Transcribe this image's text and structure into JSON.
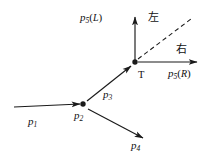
{
  "figure": {
    "kind": "momentum-vector-diagram",
    "background_color": "#ffffff",
    "stroke_color": "#1a1a1a",
    "width": 220,
    "height": 158
  },
  "vertices": [
    {
      "id": "p2",
      "label": "p",
      "subscript": "2",
      "x": 83,
      "y": 104
    },
    {
      "id": "T",
      "label": "T",
      "x": 135,
      "y": 62
    }
  ],
  "labels": {
    "p1": {
      "base": "p",
      "sub": "1",
      "x": 28,
      "y": 116
    },
    "p2": {
      "base": "p",
      "sub": "2",
      "x": 74,
      "y": 110
    },
    "p3": {
      "base": "p",
      "sub": "3",
      "x": 103,
      "y": 89
    },
    "p4": {
      "base": "p",
      "sub": "4",
      "x": 131,
      "y": 140
    },
    "p5L": {
      "base": "p",
      "sub": "5",
      "open": "(",
      "arg": "L",
      "close": ")",
      "x": 80,
      "y": 12
    },
    "p5R": {
      "base": "p",
      "sub": "5",
      "open": "(",
      "arg": "R",
      "close": ")",
      "x": 168,
      "y": 68
    },
    "vertexT": {
      "text": "T",
      "x": 138,
      "y": 70
    },
    "left_cjk": {
      "text": "左",
      "x": 148,
      "y": 12
    },
    "right_cjk": {
      "text": "右",
      "x": 176,
      "y": 44
    }
  },
  "arrows": [
    {
      "name": "p1-incoming-arrow",
      "from": [
        14,
        107
      ],
      "to": [
        80,
        104
      ],
      "style": "solid",
      "head": "end"
    },
    {
      "name": "p3-arrow",
      "from": [
        87,
        101
      ],
      "to": [
        131,
        66
      ],
      "style": "solid",
      "head": "end"
    },
    {
      "name": "p4-arrow",
      "from": [
        88,
        109
      ],
      "to": [
        143,
        138
      ],
      "style": "solid",
      "head": "end"
    },
    {
      "name": "p5-left-arrow",
      "from": [
        135,
        60
      ],
      "to": [
        135,
        17
      ],
      "style": "solid",
      "head": "end"
    },
    {
      "name": "p5-right-arrow",
      "from": [
        138,
        62
      ],
      "to": [
        197,
        62
      ],
      "style": "solid",
      "head": "end"
    },
    {
      "name": "dashed-guide-line",
      "from": [
        138,
        59
      ],
      "to": [
        191,
        19
      ],
      "style": "dashed",
      "head": "none"
    }
  ]
}
